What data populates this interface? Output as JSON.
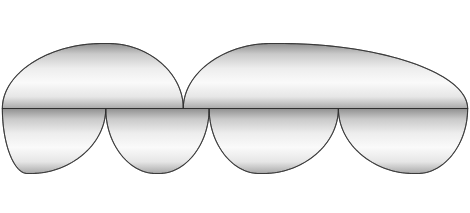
{
  "figure": {
    "projection": "Goode homolosine (interrupted sinusoidal lobes)",
    "background_color": "#ffffff",
    "land_outline_color": "#3a3a3a",
    "graticule_color": "#8a8a8a",
    "point_color": "#111111",
    "alt": "Grayscale interrupted world map showing scattered dark point clusters concentrated over the eastern Pacific, southern Atlantic, west Africa, the Southern Ocean and the western Pacific."
  },
  "chart_data": {
    "type": "scatter",
    "xlabel": "Longitude",
    "ylabel": "Latitude",
    "xlim": [
      -180,
      180
    ],
    "ylim": [
      -90,
      90
    ],
    "grid": true,
    "graticule_interval_deg": 20,
    "legend_position": "none",
    "projection": "Goode homolosine",
    "lobes": [
      {
        "name": "northern-americas-lobe",
        "hemisphere": "north",
        "central_meridian": -100,
        "lon_range": [
          -180,
          -40
        ]
      },
      {
        "name": "northern-eurasia-lobe",
        "hemisphere": "north",
        "central_meridian": 30,
        "lon_range": [
          -40,
          180
        ]
      },
      {
        "name": "southern-pacific-lobe",
        "hemisphere": "south",
        "central_meridian": -160,
        "lon_range": [
          -180,
          -100
        ]
      },
      {
        "name": "southern-americas-lobe",
        "hemisphere": "south",
        "central_meridian": -60,
        "lon_range": [
          -100,
          -20
        ]
      },
      {
        "name": "southern-africa-lobe",
        "hemisphere": "south",
        "central_meridian": 20,
        "lon_range": [
          -20,
          80
        ]
      },
      {
        "name": "southern-australia-lobe",
        "hemisphere": "south",
        "central_meridian": 140,
        "lon_range": [
          80,
          180
        ]
      }
    ],
    "clusters": [
      {
        "name": "eastern-pacific-cluster",
        "lon": -148,
        "lat": 12,
        "count": 520,
        "spread_lon": 14,
        "spread_lat": 11,
        "density": "very-high"
      },
      {
        "name": "northeast-pacific-cluster",
        "lon": -132,
        "lat": 22,
        "count": 210,
        "spread_lon": 12,
        "spread_lat": 9,
        "density": "medium"
      },
      {
        "name": "gulf-of-guinea-cluster",
        "lon": -4,
        "lat": 2,
        "count": 900,
        "spread_lon": 11,
        "spread_lat": 10,
        "density": "very-high"
      },
      {
        "name": "west-africa-coast-cluster",
        "lon": -12,
        "lat": 12,
        "count": 330,
        "spread_lon": 9,
        "spread_lat": 8,
        "density": "high"
      },
      {
        "name": "south-atlantic-cluster",
        "lon": -9,
        "lat": -30,
        "count": 420,
        "spread_lon": 8,
        "spread_lat": 11,
        "density": "high"
      },
      {
        "name": "south-american-southern-cluster",
        "lon": -52,
        "lat": -40,
        "count": 300,
        "spread_lon": 9,
        "spread_lat": 12,
        "density": "high"
      },
      {
        "name": "southern-ocean-atlantic-cluster",
        "lon": -30,
        "lat": -52,
        "count": 260,
        "spread_lon": 12,
        "spread_lat": 9,
        "density": "medium"
      },
      {
        "name": "western-pacific-cluster",
        "lon": 168,
        "lat": -6,
        "count": 380,
        "spread_lon": 10,
        "spread_lat": 12,
        "density": "high"
      },
      {
        "name": "coral-sea-cluster",
        "lon": 162,
        "lat": -20,
        "count": 200,
        "spread_lon": 9,
        "spread_lat": 9,
        "density": "medium"
      },
      {
        "name": "siberia-band-cluster",
        "lon": 110,
        "lat": 62,
        "count": 260,
        "spread_lon": 30,
        "spread_lat": 7,
        "density": "medium"
      },
      {
        "name": "north-pacific-rim-cluster",
        "lon": 176,
        "lat": 40,
        "count": 180,
        "spread_lon": 8,
        "spread_lat": 12,
        "density": "medium"
      },
      {
        "name": "arctic-north-america-cluster",
        "lon": -110,
        "lat": 68,
        "count": 150,
        "spread_lon": 26,
        "spread_lat": 6,
        "density": "low"
      }
    ]
  }
}
